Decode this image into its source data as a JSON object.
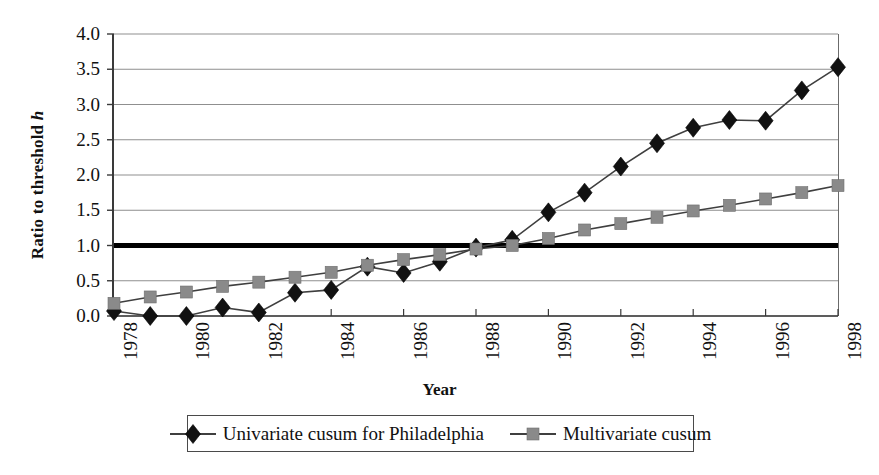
{
  "chart_data": {
    "type": "line",
    "title": "",
    "xlabel": "Year",
    "ylabel": "Ratio to threshold h",
    "ylabel_plain": "Ratio to threshold ",
    "ylabel_italic": "h",
    "x": [
      1978,
      1979,
      1980,
      1981,
      1982,
      1983,
      1984,
      1985,
      1986,
      1987,
      1988,
      1989,
      1990,
      1991,
      1992,
      1993,
      1994,
      1995,
      1996,
      1997,
      1998
    ],
    "xlim": [
      1978,
      1998
    ],
    "ylim": [
      0.0,
      4.0
    ],
    "xtick_labels": [
      "1978",
      "1980",
      "1982",
      "1984",
      "1986",
      "1988",
      "1990",
      "1992",
      "1994",
      "1996",
      "1998"
    ],
    "xticks": [
      1978,
      1980,
      1982,
      1984,
      1986,
      1988,
      1990,
      1992,
      1994,
      1996,
      1998
    ],
    "ytick_labels": [
      "0.0",
      "0.5",
      "1.0",
      "1.5",
      "2.0",
      "2.5",
      "3.0",
      "3.5",
      "4.0"
    ],
    "yticks": [
      0.0,
      0.5,
      1.0,
      1.5,
      2.0,
      2.5,
      3.0,
      3.5,
      4.0
    ],
    "grid": true,
    "grid_axis": "y",
    "legend_position": "below",
    "threshold": {
      "value": 1.0,
      "name": "threshold-line",
      "color": "#000000",
      "width": 5
    },
    "series": [
      {
        "name": "Univariate cusum for Philadelphia",
        "marker": "diamond",
        "marker_color": "#111111",
        "line_color": "#3f3f3f",
        "values": [
          0.07,
          0.0,
          0.0,
          0.12,
          0.05,
          0.33,
          0.37,
          0.7,
          0.61,
          0.77,
          0.97,
          1.08,
          1.47,
          1.75,
          2.12,
          2.45,
          2.67,
          2.78,
          2.77,
          3.2,
          3.53
        ]
      },
      {
        "name": "Multivariate cusum",
        "marker": "square",
        "marker_color": "#8a8a8a",
        "line_color": "#3f3f3f",
        "values": [
          0.18,
          0.27,
          0.34,
          0.42,
          0.48,
          0.55,
          0.62,
          0.72,
          0.8,
          0.87,
          0.95,
          1.0,
          1.1,
          1.22,
          1.31,
          1.4,
          1.49,
          1.57,
          1.66,
          1.75,
          1.85
        ]
      }
    ]
  },
  "legend": {
    "entries": [
      {
        "label": "Univariate cusum for Philadelphia"
      },
      {
        "label": "Multivariate cusum"
      }
    ]
  },
  "colors": {
    "background": "#ffffff",
    "grid": "#8f8f8f",
    "axis": "#3a3a3a",
    "series_1": "#111111",
    "series_2": "#8a8a8a",
    "threshold": "#000000"
  }
}
